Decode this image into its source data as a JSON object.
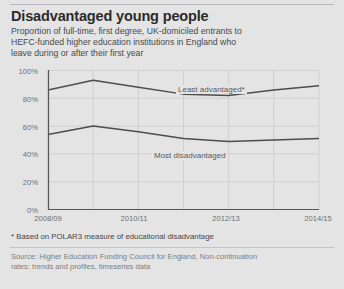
{
  "card": {
    "title": "Disadvantaged young people",
    "subtitle": "Proportion of full-time, first degree, UK-domiciled entrants to HEFC-funded higher education institutions in England who leave during or after their first year",
    "footnote": "* Based on POLAR3 measure of educational disadvantage",
    "source": "Source: Higher Education Funding Council for England, Non-continuation rates: trends and profiles, timeseries data",
    "background_color": "#e4e4e4",
    "line_color": "#4d4d4d",
    "grid_color": "#cfcfcf",
    "axis_color": "#555555",
    "title_color": "#2b2b2b",
    "subtitle_color": "#4a4a4a",
    "source_color": "#7d7d7d"
  },
  "chart_data": {
    "type": "line",
    "title": "Disadvantaged young people",
    "subtitle": "Proportion of full-time, first degree, UK-domiciled entrants to HEFC-funded higher education institutions in England who leave during or after their first year",
    "xlabel": "",
    "ylabel": "",
    "x": [
      "2008/09",
      "2009/10",
      "2010/11",
      "2011/12",
      "2012/13",
      "2013/14",
      "2014/15"
    ],
    "xtick_labels": [
      "2008/09",
      "2010/11",
      "2012/13",
      "2014/15"
    ],
    "xtick_positions": [
      0,
      2,
      4,
      6
    ],
    "ytick_labels": [
      "0%",
      "20%",
      "40%",
      "60%",
      "80%",
      "100%"
    ],
    "ytick_values": [
      0,
      20,
      40,
      60,
      80,
      100
    ],
    "ylim": [
      0,
      100
    ],
    "grid": true,
    "legend": "inline-labels",
    "series": [
      {
        "name": "Least advantaged*",
        "label": "Least advantaged*",
        "values": [
          86,
          93,
          88,
          83,
          82,
          86,
          89
        ]
      },
      {
        "name": "Most disadvantaged",
        "label": "Most disadvantaged",
        "values": [
          54,
          60,
          56,
          51,
          49,
          50,
          51
        ]
      }
    ]
  },
  "axes": {
    "y_labels": [
      "100%",
      "80%",
      "60%",
      "40%",
      "20%",
      "0%"
    ],
    "x_labels": [
      "2008/09",
      "2010/11",
      "2012/13",
      "2014/15"
    ]
  }
}
